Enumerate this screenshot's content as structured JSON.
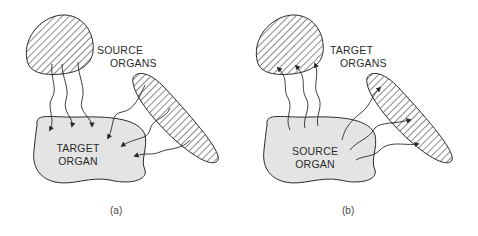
{
  "panels": [
    {
      "id": "a",
      "caption": "(a)",
      "outer_label_line1": "SOURCE",
      "outer_label_line2": "ORGANS",
      "center_label_line1": "TARGET",
      "center_label_line2": "ORGAN",
      "arrow_direction": "into-center-organ"
    },
    {
      "id": "b",
      "caption": "(b)",
      "outer_label_line1": "TARGET",
      "outer_label_line2": "ORGANS",
      "center_label_line1": "SOURCE",
      "center_label_line2": "ORGAN",
      "arrow_direction": "out-to-outer-organs"
    }
  ],
  "colors": {
    "stroke": "#2a2a2a",
    "center_fill": "#e4e4e4",
    "background": "#ffffff"
  }
}
